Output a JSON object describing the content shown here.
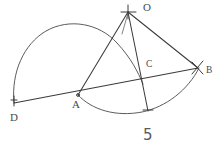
{
  "figure": {
    "caption": "5",
    "background_color": "#ffffff",
    "ink_color": "#4a4a4a",
    "points": [
      {
        "id": "O",
        "label": "O",
        "x": 128,
        "y": 12,
        "label_x": 143,
        "label_y": 2,
        "marker": "cross"
      },
      {
        "id": "D",
        "label": "D",
        "x": 14,
        "y": 103,
        "label_x": 11,
        "label_y": 113,
        "marker": "tick"
      },
      {
        "id": "A",
        "label": "A",
        "x": 78,
        "y": 95,
        "label_x": 73,
        "label_y": 101,
        "marker": "dot"
      },
      {
        "id": "C",
        "label": "C",
        "x": 140,
        "y": 73,
        "label_x": 146,
        "label_y": 63,
        "marker": "none"
      },
      {
        "id": "B",
        "label": "B",
        "x": 198,
        "y": 68,
        "label_x": 205,
        "label_y": 68,
        "marker": "arrow"
      }
    ],
    "segments": [
      {
        "name": "line-D-B",
        "from": "D",
        "to": "B",
        "d": "M 14 103 L 198 68"
      },
      {
        "name": "line-A-O",
        "from": "A",
        "to": "O",
        "d": "M 78 95 L 128 12"
      },
      {
        "name": "line-O-B",
        "from": "O",
        "to": "B",
        "d": "M 128 12 L 198 68"
      },
      {
        "name": "line-O-E",
        "from": "O",
        "to": "E",
        "d": "M 128 12 L 148 111"
      }
    ],
    "arcs": [
      {
        "name": "arc-upper-D",
        "d": "M 14 103 A 60 58 0 0 1 143 83"
      },
      {
        "name": "arc-lower-A",
        "d": "M 78 95 A 72 70 0 0 0 199 67"
      }
    ],
    "labels": {
      "O": "O",
      "D": "D",
      "A": "A",
      "C": "C",
      "B": "B",
      "caption": "5"
    }
  }
}
